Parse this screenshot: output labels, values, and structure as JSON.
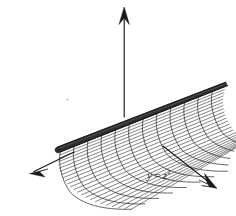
{
  "figure": {
    "title": "",
    "background_color": "#ffffff",
    "ink_color": "#1a1a1a",
    "mesh_color": "#39393c",
    "ridge_color": "#2e2e31",
    "width": 236,
    "height": 216
  },
  "labels": {
    "surface_equation": {
      "variable": "y",
      "equals": "=",
      "base": "z",
      "exponent": "2",
      "full_text": "y = z2",
      "x": 147,
      "y": 168
    }
  },
  "axes": [
    {
      "name": "vertical-axis",
      "direction": "up",
      "tip": [
        124,
        8
      ],
      "tail": [
        124,
        117
      ],
      "arrowhead": "open-v"
    },
    {
      "name": "left-axis",
      "direction": "down-left",
      "tip": [
        30,
        173
      ],
      "tail": [
        74,
        152
      ],
      "arrowhead": "open-v"
    },
    {
      "name": "right-axis",
      "direction": "down-right",
      "tip": [
        216,
        188
      ],
      "tail": [
        163,
        146
      ],
      "arrowhead": "open-v"
    }
  ],
  "chart_data": {
    "type": "line",
    "xlabel": "",
    "ylabel": "",
    "annotations": [
      "y = z2"
    ],
    "surface": {
      "equation": "y = z^2",
      "kind": "parabolic-cylinder",
      "rulings_count": 24,
      "ribs_count": 11,
      "ridge_from": [
        57,
        148
      ],
      "ridge_to": [
        226,
        83
      ]
    },
    "grid": true,
    "legend": "none"
  }
}
